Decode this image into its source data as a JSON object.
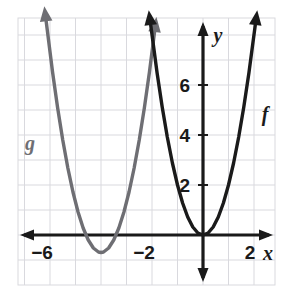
{
  "figure": {
    "width": 291,
    "height": 298,
    "background": "#ffffff",
    "plot_frame": {
      "left": 18,
      "top": 18,
      "right": 275,
      "bottom": 285
    },
    "grid": {
      "visible": true,
      "color": "#d9d9de",
      "step_units": 1
    },
    "axes": {
      "color": "#1a1a1a",
      "origin_px": {
        "x": 203,
        "y": 235
      },
      "px_per_unit_x": 25.5,
      "px_per_unit_y": 25.0,
      "x_axis_name": "x",
      "y_axis_name": "y",
      "x_range": [
        -7.25,
        2.8
      ],
      "y_range": [
        -2.0,
        8.7
      ]
    },
    "x_ticks": [
      {
        "value": -6,
        "label": "−6"
      },
      {
        "value": -2,
        "label": "−2"
      },
      {
        "value": 2,
        "label": "2"
      }
    ],
    "y_ticks": [
      {
        "value": 2,
        "label": "2"
      },
      {
        "value": 4,
        "label": "4"
      },
      {
        "value": 6,
        "label": "6"
      }
    ]
  },
  "chart_data": {
    "type": "line",
    "title": "",
    "subtitle": "",
    "xlabel": "x",
    "ylabel": "y",
    "xlim": [
      -7.25,
      2.8
    ],
    "ylim": [
      -2.0,
      8.7
    ],
    "grid": true,
    "legend": "inline-curve-labels",
    "annotations": [
      {
        "text": "f",
        "x": 2.45,
        "y": 4.8,
        "color": "#1a1a1a"
      },
      {
        "text": "g",
        "x": -6.8,
        "y": 3.7,
        "color": "#6e6e73"
      }
    ],
    "series": [
      {
        "name": "f",
        "label": "f",
        "color": "#1a1a1a",
        "equation": "y = 2x^2",
        "vertex": [
          0,
          0
        ],
        "leading_coefficient": 2,
        "arrowheads": "both-ends-up",
        "x": [
          -2.05,
          -1.8,
          -1.6,
          -1.4,
          -1.2,
          -1.0,
          -0.8,
          -0.6,
          -0.4,
          -0.2,
          0,
          0.2,
          0.4,
          0.6,
          0.8,
          1.0,
          1.2,
          1.4,
          1.6,
          1.8,
          2.05
        ],
        "y": [
          8.4,
          6.48,
          5.12,
          3.92,
          2.88,
          2.0,
          1.28,
          0.72,
          0.32,
          0.08,
          0,
          0.08,
          0.32,
          0.72,
          1.28,
          2.0,
          2.88,
          3.92,
          5.12,
          6.48,
          8.4
        ]
      },
      {
        "name": "g",
        "label": "g",
        "color": "#6e6e73",
        "equation": "y = 2(x + 4)^2 - 0.7",
        "vertex": [
          -4,
          -0.7
        ],
        "leading_coefficient": 2,
        "arrowheads": "both-ends-up",
        "x": [
          -6.15,
          -5.9,
          -5.7,
          -5.5,
          -5.3,
          -5.1,
          -4.9,
          -4.7,
          -4.5,
          -4.3,
          -4.1,
          -4.0,
          -3.9,
          -3.7,
          -3.5,
          -3.3,
          -3.1,
          -2.9,
          -2.7,
          -2.5,
          -2.3,
          -2.1,
          -1.9
        ],
        "y": [
          8.55,
          6.52,
          5.08,
          3.8,
          2.68,
          1.72,
          0.92,
          0.28,
          -0.2,
          -0.52,
          -0.68,
          -0.7,
          -0.68,
          -0.52,
          -0.2,
          0.28,
          0.92,
          1.72,
          2.68,
          3.8,
          5.08,
          6.52,
          8.12
        ]
      }
    ],
    "intersection_visual": {
      "x": -1.82,
      "y": 6.6
    }
  }
}
